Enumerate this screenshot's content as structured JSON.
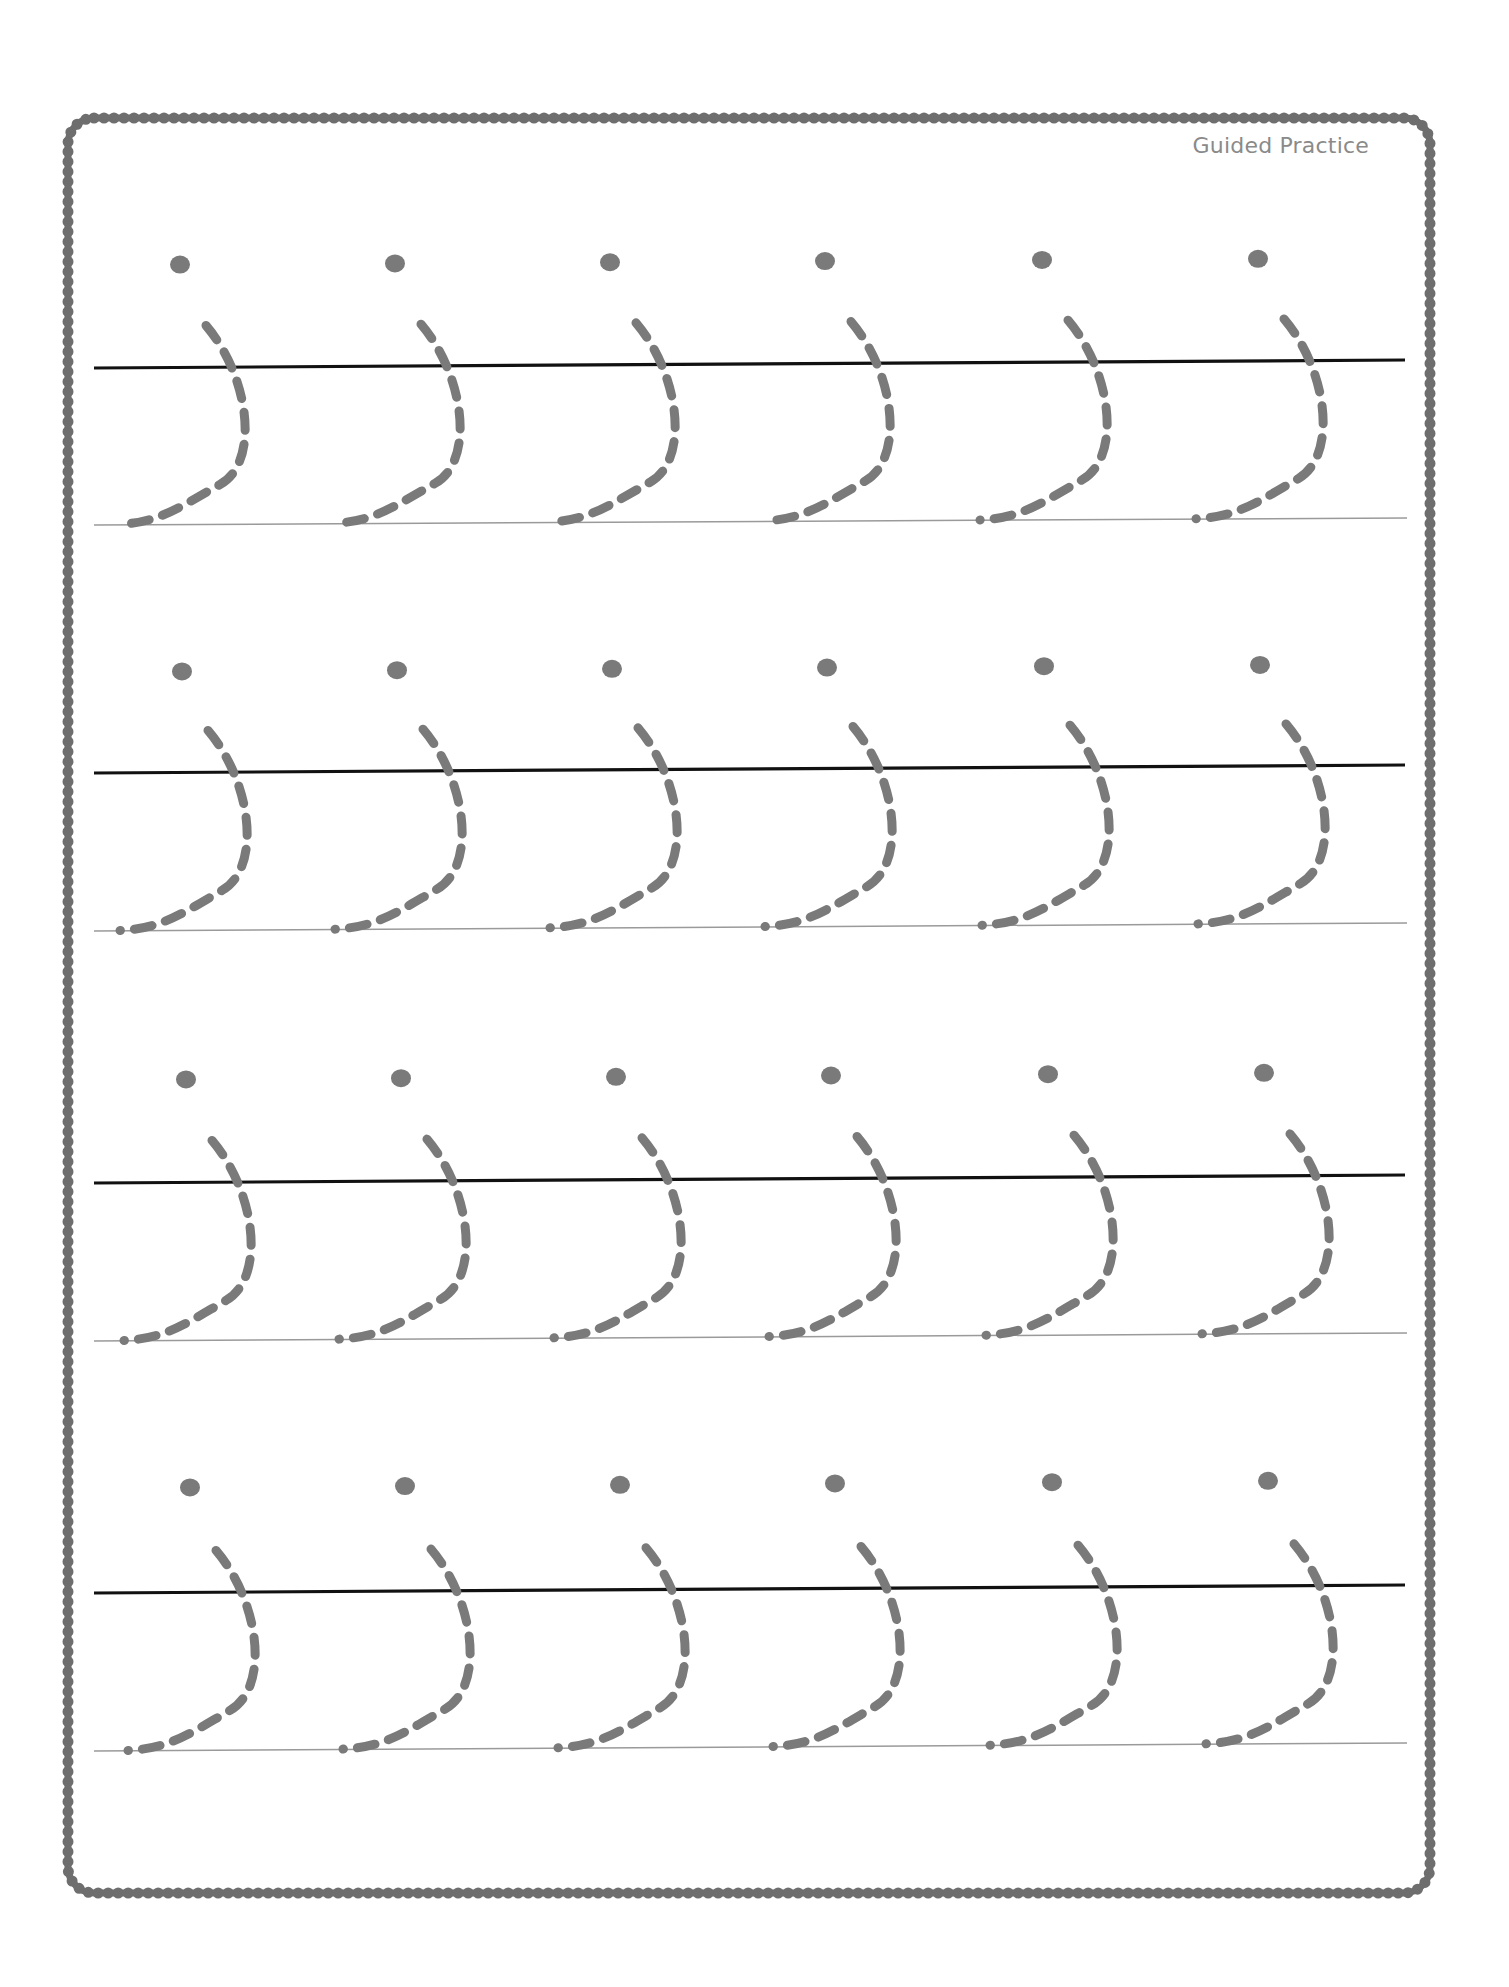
{
  "worksheet": {
    "title": "Guided Practice",
    "colors": {
      "border": "#6e6e6e",
      "top_line": "#111111",
      "baseline": "#9a9a9a",
      "trace_stroke": "#7a7a7a",
      "dot": "#7a7a7a"
    },
    "rows": [
      {
        "top_line_y": [
          368,
          360
        ],
        "baseline_y": [
          525,
          518
        ],
        "dot_y": [
          265,
          258
        ],
        "letter_x": [
          180,
          395,
          610,
          825,
          1042,
          1258
        ]
      },
      {
        "top_line_y": [
          773,
          765
        ],
        "baseline_y": [
          931,
          923
        ],
        "dot_y": [
          672,
          664
        ],
        "letter_x": [
          182,
          397,
          612,
          827,
          1044,
          1260
        ]
      },
      {
        "top_line_y": [
          1183,
          1175
        ],
        "baseline_y": [
          1341,
          1333
        ],
        "dot_y": [
          1080,
          1072
        ],
        "letter_x": [
          186,
          401,
          616,
          831,
          1048,
          1264
        ]
      },
      {
        "top_line_y": [
          1593,
          1585
        ],
        "baseline_y": [
          1751,
          1743
        ],
        "dot_y": [
          1488,
          1480
        ],
        "letter_x": [
          190,
          405,
          620,
          835,
          1052,
          1268
        ]
      }
    ],
    "letters_per_row": 6,
    "row_count": 4
  }
}
